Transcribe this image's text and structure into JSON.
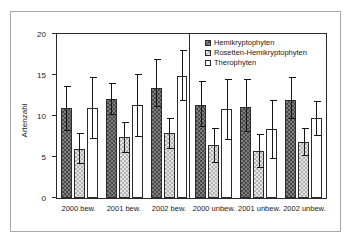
{
  "chart_data": {
    "type": "bar",
    "title": "",
    "xlabel": "",
    "ylabel": "Artenzahl",
    "ylim": [
      0,
      20
    ],
    "yticks": [
      0,
      5,
      10,
      15,
      20
    ],
    "ytick_labels": [
      "0",
      "5",
      "10",
      "15",
      "20"
    ],
    "grid": false,
    "legend_position": "top-right",
    "categories": [
      "2000 bew.",
      "2001 bew.",
      "2002 bew.",
      "2000 unbew.",
      "2001 unbew.",
      "2002 unbew."
    ],
    "group_separator_after_index": 2,
    "series": [
      {
        "name": "Hemikryptophyten",
        "fill": "dark-checker",
        "color": "#7d7d7d",
        "values": [
          11.0,
          12.1,
          13.4,
          11.4,
          11.1,
          11.9
        ],
        "error_low": [
          8.2,
          10.1,
          11.1,
          8.6,
          8.0,
          9.6
        ],
        "error_high": [
          13.7,
          14.0,
          17.0,
          14.3,
          14.5,
          14.8
        ]
      },
      {
        "name": "Rosetten-Hemikryptophyten",
        "fill": "light-checker",
        "color": "#e3e3e3",
        "values": [
          6.0,
          7.4,
          7.9,
          6.5,
          5.7,
          6.8
        ],
        "error_low": [
          4.2,
          5.5,
          6.0,
          4.3,
          3.6,
          5.1
        ],
        "error_high": [
          7.9,
          9.3,
          9.8,
          8.5,
          7.8,
          8.5
        ]
      },
      {
        "name": "Therophyten",
        "fill": "white",
        "color": "#ffffff",
        "values": [
          11.0,
          11.3,
          14.9,
          10.8,
          8.4,
          9.7
        ],
        "error_low": [
          7.2,
          7.5,
          11.8,
          7.1,
          4.8,
          7.6
        ],
        "error_high": [
          14.8,
          15.1,
          18.0,
          14.5,
          12.0,
          11.8
        ]
      }
    ]
  },
  "legend": {
    "items": [
      {
        "label": "Hemikryptophyten"
      },
      {
        "label": "Rosetten-Hemikryptophyten"
      },
      {
        "label": "Therophyten"
      }
    ]
  }
}
